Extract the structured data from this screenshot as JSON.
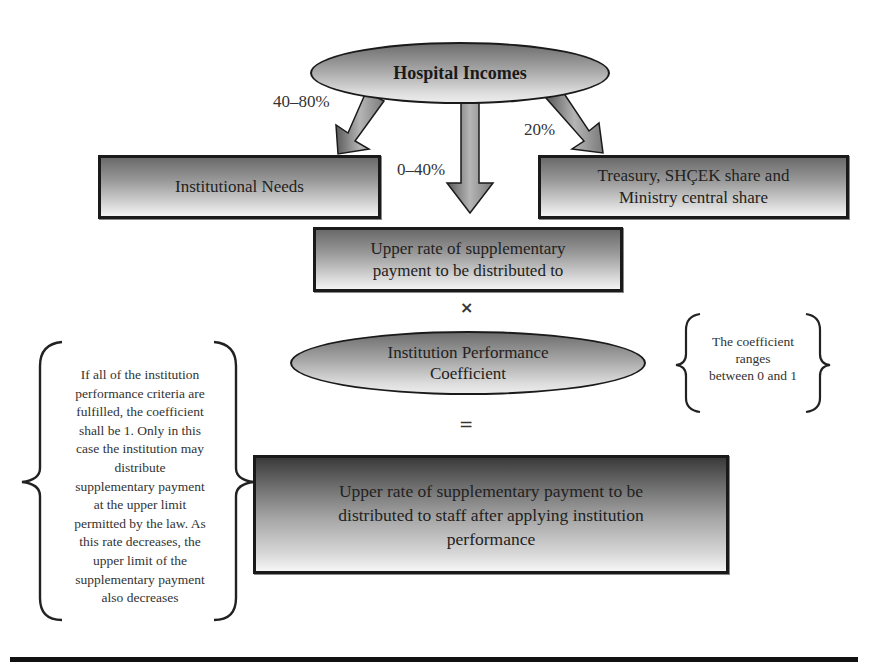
{
  "diagram": {
    "source_node": {
      "label": "Hospital Incomes"
    },
    "arrows": [
      {
        "id": "left",
        "label": "40–80%",
        "target": "Institutional Needs"
      },
      {
        "id": "center",
        "label": "0–40%",
        "target": "Upper rate of supplementary payment to be distributed to"
      },
      {
        "id": "right",
        "label": "20%",
        "target": "Treasury, SHÇEK share and Ministry central share"
      }
    ],
    "institutional_needs": {
      "label": "Institutional Needs"
    },
    "treasury": {
      "line1": "Treasury, SHÇEK share and",
      "line2": "Ministry central share"
    },
    "upper_rate": {
      "line1": "Upper rate of supplementary",
      "line2": "payment to be distributed to"
    },
    "multiply_symbol": "×",
    "coefficient": {
      "line1": "Institution Performance",
      "line2": "Coefficient"
    },
    "coefficient_note": {
      "line1": "The coefficient",
      "line2": "ranges",
      "line3": "between 0 and 1"
    },
    "equals_symbol": "=",
    "result": {
      "line1": "Upper rate of supplementary payment to be",
      "line2": "distributed to staff after applying institution",
      "line3": "performance"
    },
    "criteria_note": {
      "lines": [
        "If all of the institution",
        "performance criteria are",
        "fulfilled, the coefficient",
        "shall be 1. Only in this",
        "case the institution may",
        "distribute",
        "supplementary payment",
        "at the upper limit",
        "permitted by the law. As",
        "this rate decreases, the",
        "upper limit of the",
        "supplementary payment",
        "also decreases"
      ]
    }
  },
  "colors": {
    "stroke": "#1a1a1a",
    "fill_dark": "#6a6a6a",
    "fill_light": "#f4f4f4",
    "text": "#222222"
  }
}
